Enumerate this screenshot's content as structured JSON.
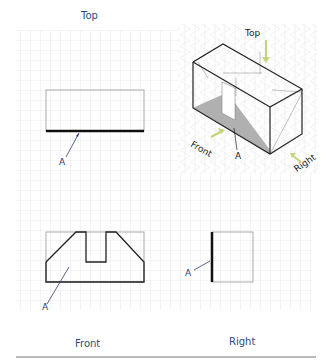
{
  "figure": {
    "type": "orthographic-projection",
    "views": {
      "top": {
        "label": "Top",
        "marker": "A"
      },
      "front": {
        "label": "Front",
        "marker": "A"
      },
      "right": {
        "label": "Right",
        "marker": "A"
      }
    },
    "isometric": {
      "arrows": [
        "Top",
        "Front",
        "Right"
      ],
      "marker": "A"
    }
  },
  "colors": {
    "grid": "#e6e6e6",
    "outline": "#222222",
    "shade": "#b3b3b3",
    "arrow": "#c5d47a",
    "marker_text": "#2b3b6f",
    "label_text": "#2b4a7a"
  }
}
